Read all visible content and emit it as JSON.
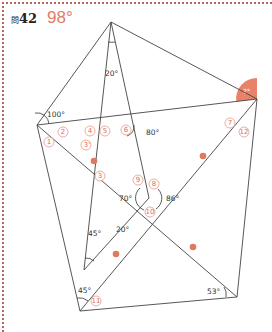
{
  "header": {
    "question_prefix": "問",
    "question_number": "42",
    "answer": "98°"
  },
  "colors": {
    "accent": "#e07d5f",
    "frame": "#b5655a",
    "line": "#444444"
  },
  "angles": {
    "left": "100°",
    "top": "20°",
    "mid_right": "80°",
    "target": "?°",
    "center_left": "70°",
    "center_right": "86°",
    "inner_bottom_left": "45°",
    "inner_lower": "20°",
    "bottom_left": "45°",
    "bottom_right": "53°"
  },
  "markers": {
    "m1": "1",
    "m2": "2",
    "m3": "3",
    "m3p": "3'",
    "m4": "4",
    "m5": "5",
    "m6": "6",
    "m7": "7",
    "m8": "8",
    "m9": "9",
    "m10": "10",
    "m11": "11",
    "m12": "12"
  }
}
